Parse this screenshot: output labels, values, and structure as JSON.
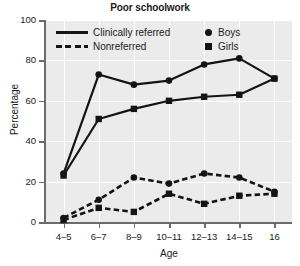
{
  "chart_data": {
    "type": "line",
    "title": "Poor schoolwork",
    "xlabel": "Age",
    "ylabel": "Percentage",
    "categories": [
      "4-5",
      "6-7",
      "8-9",
      "10-11",
      "12-13",
      "14-15",
      "16"
    ],
    "ylim": [
      0,
      100
    ],
    "yticks": [
      0,
      20,
      40,
      60,
      80,
      100
    ],
    "grid": true,
    "legend_position": "top-inside",
    "series": [
      {
        "name": "Clinically referred Boys",
        "group": "Clinically referred",
        "sex": "Boys",
        "linestyle": "solid",
        "marker": "circle",
        "color": "#141414",
        "values": [
          24,
          73,
          68,
          70,
          78,
          81,
          71
        ]
      },
      {
        "name": "Clinically referred Girls",
        "group": "Clinically referred",
        "sex": "Girls",
        "linestyle": "solid",
        "marker": "square",
        "color": "#141414",
        "values": [
          23,
          51,
          56,
          60,
          62,
          63,
          71
        ]
      },
      {
        "name": "Nonreferred Boys",
        "group": "Nonreferred",
        "sex": "Boys",
        "linestyle": "dashed",
        "marker": "circle",
        "color": "#141414",
        "values": [
          2,
          11,
          22,
          19,
          24,
          22,
          15
        ]
      },
      {
        "name": "Nonreferred Girls",
        "group": "Nonreferred",
        "sex": "Girls",
        "linestyle": "dashed",
        "marker": "square",
        "color": "#141414",
        "values": [
          1,
          7,
          5,
          14,
          9,
          13,
          14
        ]
      }
    ],
    "legend": [
      {
        "label": "Clinically referred",
        "swatch": "solid-line"
      },
      {
        "label": "Nonreferred",
        "swatch": "dashed-line"
      },
      {
        "label": "Boys",
        "swatch": "circle-marker"
      },
      {
        "label": "Girls",
        "swatch": "square-marker"
      }
    ]
  },
  "colors": {
    "plot_background": "#ebebeb",
    "gridline": "#ffffff",
    "axis": "#6b6b6b",
    "ink": "#141414"
  }
}
